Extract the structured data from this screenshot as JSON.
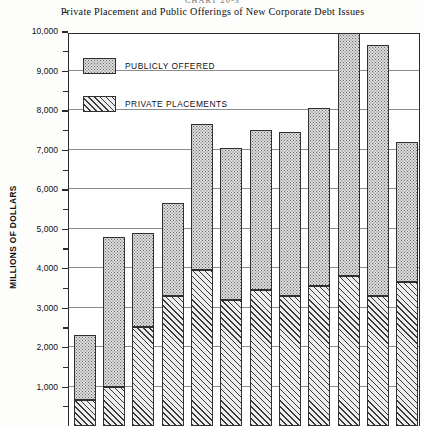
{
  "figure": {
    "chart_number": "CHART 20-3",
    "title": "Private Placement and Public Offerings of New Corporate Debt Issues",
    "y_axis_title": "MILLIONS OF DOLLARS"
  },
  "legend": {
    "position": "top-left-inside-plot",
    "entries": [
      {
        "label": "PUBLICLY  OFFERED",
        "pattern": "stipple",
        "swatch_name": "publicly-offered-swatch"
      },
      {
        "label": "PRIVATE  PLACEMENTS",
        "pattern": "diagonal-hatch",
        "swatch_name": "private-placements-swatch"
      }
    ]
  },
  "axis": {
    "y_ticks_major": [
      "11,000",
      "10,000",
      "9,000",
      "8,000",
      "7,000",
      "6,000",
      "5,000",
      "4,000",
      "3,000",
      "2,000",
      "1,000"
    ],
    "y_tick_values_major": [
      11000,
      10000,
      9000,
      8000,
      7000,
      6000,
      5000,
      4000,
      3000,
      2000,
      1000
    ],
    "y_ticks_minor_values": [
      10500,
      9500,
      8500,
      7500,
      6500,
      5500,
      4500,
      3500,
      2500,
      1500,
      500
    ],
    "y_min": 0,
    "y_max": 11000,
    "x_tick_labels_visible": false
  },
  "chart_data": {
    "type": "bar",
    "title": "Private Placement and Public Offerings of New Corporate Debt Issues",
    "subtitle": "CHART 20-3",
    "xlabel": "",
    "ylabel": "MILLIONS OF DOLLARS",
    "ylim": [
      0,
      11000
    ],
    "stacked": true,
    "grid": true,
    "legend_position": "upper left",
    "categories": [
      "1",
      "2",
      "3",
      "4",
      "5",
      "6",
      "7",
      "8",
      "9",
      "10",
      "11",
      "12"
    ],
    "series": [
      {
        "name": "PRIVATE  PLACEMENTS",
        "pattern": "diagonal-hatch",
        "values": [
          650,
          1000,
          2500,
          3300,
          3950,
          3200,
          3450,
          3300,
          3550,
          3800,
          3300,
          3650
        ]
      },
      {
        "name": "PUBLICLY  OFFERED",
        "pattern": "stipple",
        "values": [
          1650,
          3800,
          2400,
          2350,
          3700,
          3850,
          4050,
          4150,
          4500,
          6150,
          6350,
          3550
        ]
      }
    ],
    "totals": [
      2300,
      4800,
      4900,
      5650,
      7650,
      7050,
      7500,
      7450,
      8050,
      9950,
      9650,
      7200
    ]
  },
  "colors": {
    "axis": "#2a2a2a",
    "gridline": "#8d8d8d",
    "bar_outline": "#303030",
    "public_fill": "#dcdcdc",
    "private_fill": "#ededed",
    "page_background": "#fdfdfb"
  }
}
